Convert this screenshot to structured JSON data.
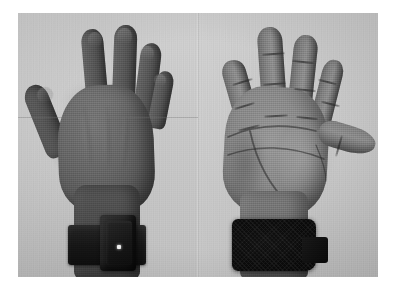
{
  "figure": {
    "caption": "",
    "rendering": "grayscale photograph",
    "background_color": "#ffffff",
    "surface_color": "#c9c9c9",
    "frame": {
      "left": 18,
      "top": 13,
      "width": 360,
      "height": 264
    },
    "panel_count": 2
  },
  "panels": [
    {
      "id": "dorsal",
      "view_label": "dorsal",
      "description": "back of hand, fingers spread, palm facing away from camera",
      "hand_orientation": "fingers up, thumb to the left",
      "skin_tone_hex": "#6d6459",
      "background_hex": "#c7c7c7",
      "fingers": [
        {
          "name": "thumb",
          "label": "thumb"
        },
        {
          "name": "index",
          "label": "index finger"
        },
        {
          "name": "middle",
          "label": "middle finger"
        },
        {
          "name": "ring",
          "label": "ring finger"
        },
        {
          "name": "pinky",
          "label": "little finger"
        }
      ],
      "device": {
        "name": "wrist-device",
        "label": "wrist-mounted sensor unit",
        "strap_label": "wrist strap",
        "strap_color_hex": "#1b1814",
        "housing_color_hex": "#211d19",
        "indicator_label": "status LED",
        "indicator_color_hex": "#f2f0ea"
      }
    },
    {
      "id": "palmar",
      "view_label": "palmar",
      "description": "palm of hand, fingers spread, thumb abducted to the right",
      "hand_orientation": "fingers up, thumb to the right",
      "skin_tone_hex": "#95877 6",
      "background_hex": "#c6c6c6",
      "fingers": [
        {
          "name": "index",
          "label": "index finger"
        },
        {
          "name": "middle",
          "label": "middle finger"
        },
        {
          "name": "ring",
          "label": "ring finger"
        },
        {
          "name": "pinky",
          "label": "little finger"
        },
        {
          "name": "thumb",
          "label": "thumb"
        }
      ],
      "palm_lines": [
        {
          "name": "heart-line",
          "label": "heart line"
        },
        {
          "name": "head-line",
          "label": "head line"
        },
        {
          "name": "life-line",
          "label": "life line"
        },
        {
          "name": "wrist-crease",
          "label": "wrist crease"
        }
      ],
      "device": {
        "name": "wrist-strap",
        "label": "dark textured wrist strap",
        "strap_color_hex": "#0f0d0c",
        "texture": "velcro"
      }
    }
  ]
}
